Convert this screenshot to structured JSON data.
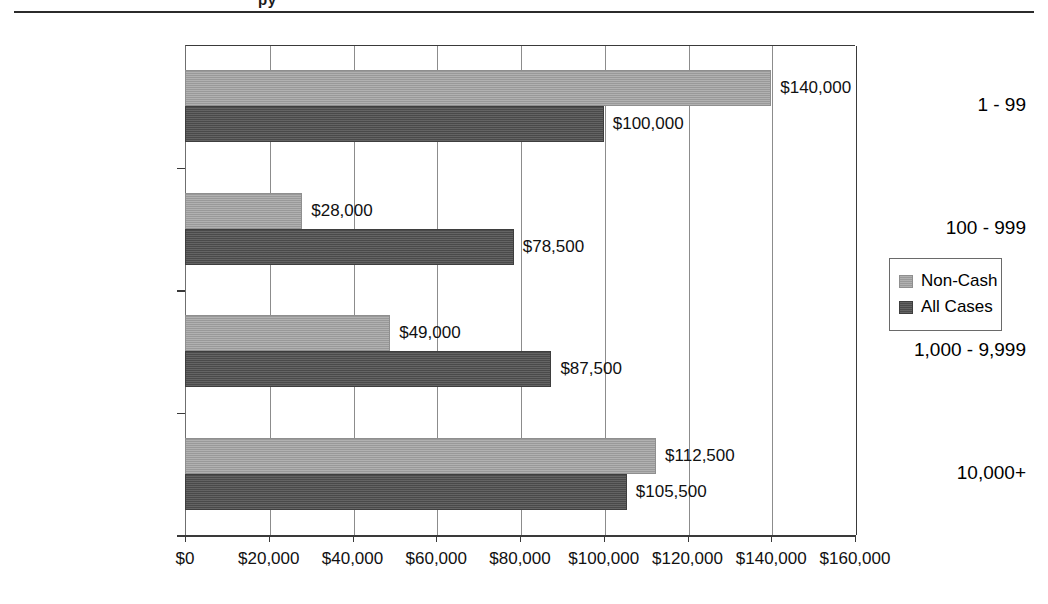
{
  "page": {
    "clipped_heading": "py"
  },
  "chart_data": {
    "type": "bar",
    "orientation": "horizontal",
    "title": "",
    "xlabel": "",
    "ylabel": "",
    "categories": [
      "1 - 99",
      "100 - 999",
      "1,000 - 9,999",
      "10,000+"
    ],
    "series": [
      {
        "name": "Non-Cash",
        "color": "#a5a5a5",
        "values": [
          140000,
          28000,
          49000,
          112500
        ],
        "labels": [
          "$140,000",
          "$28,000",
          "$49,000",
          "$112,500"
        ]
      },
      {
        "name": "All Cases",
        "color": "#525252",
        "values": [
          100000,
          78500,
          87500,
          105500
        ],
        "labels": [
          "$100,000",
          "$78,500",
          "$87,500",
          "$105,500"
        ]
      }
    ],
    "xlim": [
      0,
      160000
    ],
    "xticks": [
      0,
      20000,
      40000,
      60000,
      80000,
      100000,
      120000,
      140000,
      160000
    ],
    "xticklabels": [
      "$0",
      "$20,000",
      "$40,000",
      "$60,000",
      "$80,000",
      "$100,000",
      "$120,000",
      "$140,000",
      "$160,000"
    ],
    "grid": true,
    "grid_axis": "x",
    "legend_position": "right-outside",
    "legend_entries": [
      "Non-Cash",
      "All Cases"
    ]
  }
}
